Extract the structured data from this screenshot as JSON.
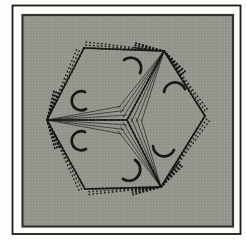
{
  "colors": {
    "line": "#181714",
    "frame_border": "#1b1a17",
    "panel_border": "#34332e",
    "panel_bg": "#97968e",
    "panel_dot_dark": "#85847d",
    "panel_dot_light": "#a6a59c",
    "page_bg": "#fdfdfb"
  },
  "figure": {
    "center": [
      127,
      120
    ],
    "hexagon": [
      [
        47,
        120
      ],
      [
        84,
        48
      ],
      [
        164,
        51
      ],
      [
        205,
        116
      ],
      [
        161,
        187
      ],
      [
        85,
        189
      ]
    ],
    "hinges": [
      {
        "name": "left-hinge",
        "at": [
          47,
          120
        ],
        "adjacent": [
          {
            "to": [
              84,
              48
            ],
            "outward": 1
          },
          {
            "to": [
              85,
              189
            ],
            "outward": -1
          }
        ]
      },
      {
        "name": "top-right-hinge",
        "at": [
          164,
          51
        ],
        "adjacent": [
          {
            "to": [
              84,
              48
            ],
            "outward": -1
          },
          {
            "to": [
              205,
              116
            ],
            "outward": 1
          }
        ]
      },
      {
        "name": "bottom-right-hinge",
        "at": [
          161,
          187
        ],
        "adjacent": [
          {
            "to": [
              205,
              116
            ],
            "outward": -1
          },
          {
            "to": [
              85,
              189
            ],
            "outward": 1
          }
        ]
      }
    ],
    "hex_edges": [
      {
        "from": [
          47,
          120
        ],
        "to": [
          84,
          48
        ],
        "pivot": [
          47,
          120
        ],
        "outward": 1
      },
      {
        "from": [
          84,
          48
        ],
        "to": [
          164,
          51
        ],
        "pivot": [
          164,
          51
        ],
        "outward": -1
      },
      {
        "from": [
          164,
          51
        ],
        "to": [
          205,
          116
        ],
        "pivot": [
          164,
          51
        ],
        "outward": 1
      },
      {
        "from": [
          205,
          116
        ],
        "to": [
          161,
          187
        ],
        "pivot": [
          161,
          187
        ],
        "outward": -1
      },
      {
        "from": [
          161,
          187
        ],
        "to": [
          85,
          189
        ],
        "pivot": [
          161,
          187
        ],
        "outward": 1
      },
      {
        "from": [
          85,
          189
        ],
        "to": [
          47,
          120
        ],
        "pivot": [
          47,
          120
        ],
        "outward": -1
      }
    ],
    "fan_angles": [
      3.5,
      7,
      10.5
    ],
    "fan_shrink": [
      1.0,
      0.97,
      0.94
    ],
    "wing_angles": [
      4.5,
      9,
      13.5
    ],
    "wing_fraction": 0.38,
    "edge_copy_angles": [
      2.2,
      4.4
    ],
    "arrows": [
      {
        "name": "rotation-arrow-upper-piece-top",
        "path": "M 124,60 A 10.5 10.5 0 0 1 140,73"
      },
      {
        "name": "rotation-arrow-right-piece-top",
        "path": "M 164,92 A 11 11 0 0 1 185,89"
      },
      {
        "name": "rotation-arrow-upper-piece-left",
        "path": "M 85,92 A 9.5 9.5 0 1 0 86,109"
      },
      {
        "name": "rotation-arrow-lower-piece-left",
        "path": "M 85,132 A 9.5 9.5 0 1 0 86,149"
      },
      {
        "name": "rotation-arrow-right-piece-bottom",
        "path": "M 153,146 A 11 11 0 0 0 174,150"
      },
      {
        "name": "rotation-arrow-lower-piece-bottom",
        "path": "M 135,160 A 11 11 0 0 1 123,179"
      }
    ]
  }
}
